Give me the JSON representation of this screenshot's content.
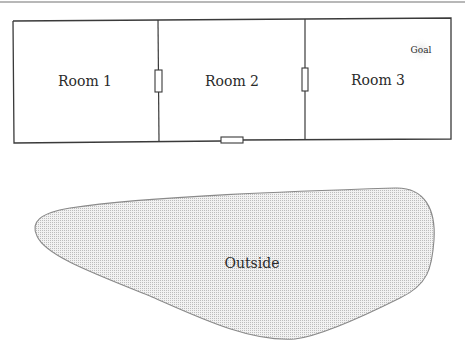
{
  "diagram": {
    "type": "floor-plan",
    "rooms": [
      {
        "id": "room1",
        "label": "Room 1"
      },
      {
        "id": "room2",
        "label": "Room 2"
      },
      {
        "id": "room3",
        "label": "Room 3"
      }
    ],
    "doors": [
      {
        "id": "door-room1-room2",
        "between": [
          "Room 1",
          "Room 2"
        ],
        "orientation": "vertical"
      },
      {
        "id": "door-room2-room3",
        "between": [
          "Room 2",
          "Room 3"
        ],
        "orientation": "vertical"
      },
      {
        "id": "door-room2-outside",
        "between": [
          "Room 2",
          "Outside"
        ],
        "orientation": "horizontal"
      }
    ],
    "goal": {
      "label": "Goal",
      "location": "Room 3"
    },
    "outside": {
      "label": "Outside"
    },
    "colors": {
      "wall": "#3a3a3a",
      "outside_fill": "#e4e4e4",
      "outside_stroke": "#8a8a8a",
      "goal_halo": "#ececec"
    }
  }
}
